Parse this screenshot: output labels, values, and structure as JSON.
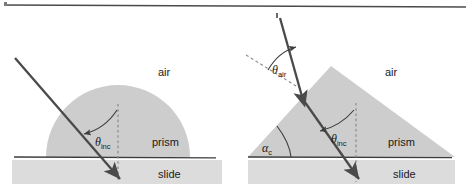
{
  "figure": {
    "width": 472,
    "height": 191
  },
  "colors": {
    "background": "#ffffff",
    "prism_fill": "#cdcdcd",
    "slide_fill": "#dcdcdc",
    "line_dark": "#3c3c3c",
    "ray": "#4a4a4a",
    "dashed_normal": "#8a8a8a",
    "text": "#1a1a1a",
    "top_rule": "#4a4a4a"
  },
  "left_panel": {
    "name": "hemispherical-prism-diagram",
    "labels": {
      "air": "air",
      "prism": "prism",
      "slide": "slide",
      "theta_inc_symbol": "θ",
      "theta_inc_subscript": "inc"
    },
    "geometry": {
      "semicircle_center_x": 118,
      "semicircle_center_y": 157,
      "semicircle_radius": 72,
      "baseline_y": 157,
      "slide_top_y": 160,
      "slide_bottom_y": 184,
      "slide_left_x": 12,
      "slide_right_x": 222,
      "normal_x": 118,
      "normal_top_y": 104,
      "ray_start_x": 15,
      "ray_start_y": 58,
      "ray_end_x": 120,
      "ray_end_y": 178
    }
  },
  "right_panel": {
    "name": "triangular-prism-diagram",
    "labels": {
      "air": "air",
      "prism": "prism",
      "slide": "slide",
      "theta_air_symbol": "θ",
      "theta_air_subscript": "air",
      "theta_inc_symbol": "θ",
      "theta_inc_subscript": "inc",
      "alpha_c_symbol": "α",
      "alpha_c_subscript": "c"
    },
    "geometry": {
      "triangle_apex_x": 331,
      "triangle_apex_y": 66,
      "triangle_left_x": 248,
      "triangle_right_x": 455,
      "baseline_y": 157,
      "slide_top_y": 160,
      "slide_bottom_y": 184,
      "slide_left_x": 248,
      "slide_right_x": 455,
      "normal_x": 356,
      "normal_top_y": 103,
      "ray_start_x": 280,
      "ray_start_y": 18,
      "ray_entry_x": 302,
      "ray_entry_y": 99,
      "ray_end_x": 358,
      "ray_end_y": 178,
      "air_dashed_start_x": 246,
      "air_dashed_start_y": 55,
      "air_dashed_end_x": 300,
      "air_dashed_end_y": 88
    }
  }
}
